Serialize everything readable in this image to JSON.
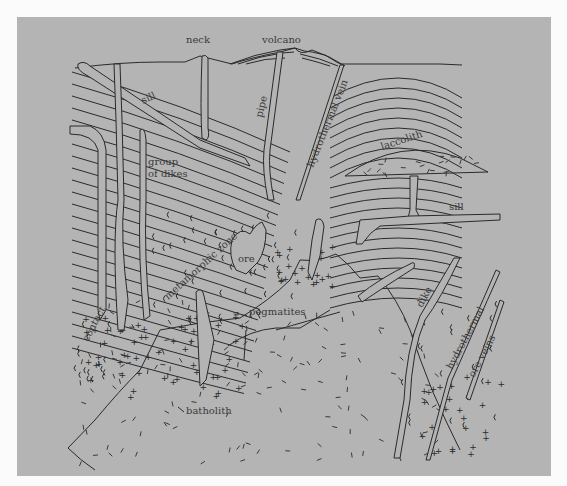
{
  "diagram": {
    "background_color": "#b4b4b4",
    "line_color": "#2a2a2a",
    "labels": {
      "neck": "neck",
      "volcano": "volcano",
      "sill_upper": "sill",
      "pipe": "pipe",
      "hydrothermal_vein": "hydrothermal vein",
      "laccolith": "laccolith",
      "group_of_dikes_line1": "group",
      "group_of_dikes_line2": "of dikes",
      "sill_lower": "sill",
      "metamorphic_zone": "metamorphic zone",
      "ore": "ore",
      "contact": "contact",
      "pegmatites": "pegmatites",
      "batholith": "batholith",
      "dike": "dike",
      "hydrothermal_ore_veins_line1": "hydrothermal",
      "hydrothermal_ore_veins_line2": "ore veins"
    }
  }
}
